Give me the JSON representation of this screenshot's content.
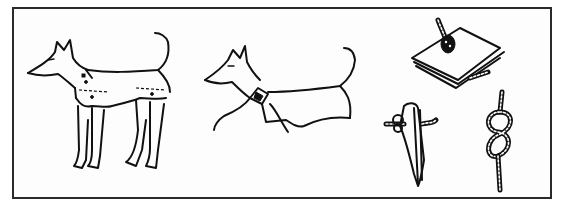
{
  "illustration": {
    "panels": [
      {
        "id": "dog-in-coat",
        "description": "Standing dog wearing a buttoned coat with leg sleeves"
      },
      {
        "id": "dog-with-collar-blanket",
        "description": "Dog with a collar and blanket draped over its back"
      },
      {
        "id": "rope-knots",
        "description": "Knot examples: rope through folded cloth, knotted cloth tie, figure-eight knot"
      }
    ],
    "colors": {
      "ink": "#111111",
      "frame": "#2a2a2a",
      "background": "#ffffff"
    }
  }
}
